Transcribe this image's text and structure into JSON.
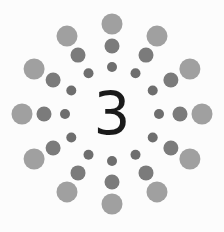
{
  "figure": {
    "numeral": "3",
    "center": [
      112,
      114
    ],
    "spoke_count": 12,
    "rings": [
      {
        "name": "inner",
        "distance": 47,
        "radius": 5,
        "color": "#6e6e6e"
      },
      {
        "name": "middle",
        "distance": 68,
        "radius": 7.5,
        "color": "#7b7b7b"
      },
      {
        "name": "outer",
        "distance": 90,
        "radius": 10.5,
        "color": "#a0a0a0"
      }
    ],
    "colors": {
      "background": "#fcfcfc",
      "numeral": "#1a1a1a"
    }
  }
}
